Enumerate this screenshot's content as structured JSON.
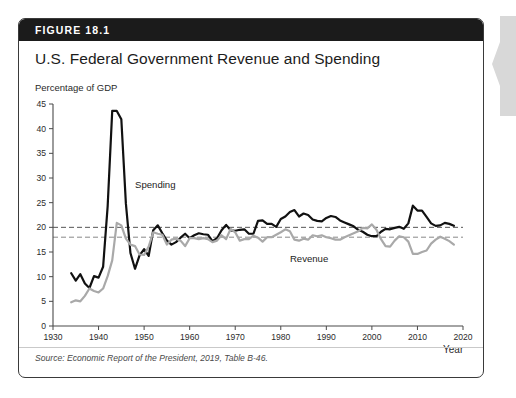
{
  "figure": {
    "number": "FIGURE 18.1",
    "title": "U.S. Federal Government Revenue and Spending",
    "source": "Source: Economic Report of the President, 2019, Table B-46.",
    "header_bg": "#1b1b1b",
    "card_border": "#3a3a3a"
  },
  "chart_data": {
    "type": "line",
    "title": "U.S. Federal Government Revenue and Spending",
    "ylabel": "Percentage of GDP",
    "xlabel": "Year",
    "xlim": [
      1930,
      2020
    ],
    "ylim": [
      0,
      45
    ],
    "xticks": [
      1930,
      1940,
      1950,
      1960,
      1970,
      1980,
      1990,
      2000,
      2010,
      2020
    ],
    "yticks": [
      0,
      5,
      10,
      15,
      20,
      25,
      30,
      35,
      40,
      45
    ],
    "grid": false,
    "legend": "inline-annotations",
    "annotations": [
      {
        "text": "Spending",
        "x": 1948,
        "y": 28.0,
        "color": "#1c1c1c"
      },
      {
        "text": "Revenue",
        "x": 1982,
        "y": 13.0,
        "color": "#1c1c1c"
      }
    ],
    "reference_lines": [
      {
        "label": "Average spending",
        "value": 20.0,
        "style": "dashed",
        "color": "#555555"
      },
      {
        "label": "Average revenue",
        "value": 18.0,
        "style": "dashed",
        "color": "#888888"
      }
    ],
    "series": [
      {
        "name": "Spending",
        "color": "#111111",
        "width": 2.2,
        "x": [
          1934,
          1935,
          1936,
          1937,
          1938,
          1939,
          1940,
          1941,
          1942,
          1943,
          1944,
          1945,
          1946,
          1947,
          1948,
          1949,
          1950,
          1951,
          1952,
          1953,
          1954,
          1955,
          1956,
          1957,
          1958,
          1959,
          1960,
          1961,
          1962,
          1963,
          1964,
          1965,
          1966,
          1967,
          1968,
          1969,
          1970,
          1971,
          1972,
          1973,
          1974,
          1975,
          1976,
          1977,
          1978,
          1979,
          1980,
          1981,
          1982,
          1983,
          1984,
          1985,
          1986,
          1987,
          1988,
          1989,
          1990,
          1991,
          1992,
          1993,
          1994,
          1995,
          1996,
          1997,
          1998,
          1999,
          2000,
          2001,
          2002,
          2003,
          2004,
          2005,
          2006,
          2007,
          2008,
          2009,
          2010,
          2011,
          2012,
          2013,
          2014,
          2015,
          2016,
          2017,
          2018
        ],
        "values": [
          10.7,
          9.2,
          10.5,
          8.6,
          7.7,
          10.1,
          9.8,
          12.0,
          24.3,
          43.6,
          43.6,
          41.9,
          24.8,
          14.8,
          11.6,
          14.3,
          15.6,
          14.2,
          19.4,
          20.4,
          18.8,
          17.3,
          16.5,
          17.0,
          17.9,
          18.7,
          17.8,
          18.4,
          18.8,
          18.6,
          18.5,
          17.2,
          17.8,
          19.4,
          20.5,
          19.4,
          19.3,
          19.5,
          19.6,
          18.7,
          18.7,
          21.3,
          21.4,
          20.7,
          20.7,
          20.1,
          21.7,
          22.2,
          23.1,
          23.5,
          22.2,
          22.8,
          22.5,
          21.6,
          21.3,
          21.2,
          21.9,
          22.3,
          22.1,
          21.4,
          21.0,
          20.6,
          20.2,
          19.5,
          19.1,
          18.5,
          18.2,
          18.2,
          19.1,
          19.7,
          19.6,
          19.9,
          20.1,
          19.7,
          20.8,
          24.4,
          23.4,
          23.4,
          22.1,
          20.8,
          20.3,
          20.4,
          20.9,
          20.7,
          20.3
        ]
      },
      {
        "name": "Revenue",
        "color": "#a9a9a9",
        "width": 2.2,
        "x": [
          1934,
          1935,
          1936,
          1937,
          1938,
          1939,
          1940,
          1941,
          1942,
          1943,
          1944,
          1945,
          1946,
          1947,
          1948,
          1949,
          1950,
          1951,
          1952,
          1953,
          1954,
          1955,
          1956,
          1957,
          1958,
          1959,
          1960,
          1961,
          1962,
          1963,
          1964,
          1965,
          1966,
          1967,
          1968,
          1969,
          1970,
          1971,
          1972,
          1973,
          1974,
          1975,
          1976,
          1977,
          1978,
          1979,
          1980,
          1981,
          1982,
          1983,
          1984,
          1985,
          1986,
          1987,
          1988,
          1989,
          1990,
          1991,
          1992,
          1993,
          1994,
          1995,
          1996,
          1997,
          1998,
          1999,
          2000,
          2001,
          2002,
          2003,
          2004,
          2005,
          2006,
          2007,
          2008,
          2009,
          2010,
          2011,
          2012,
          2013,
          2014,
          2015,
          2016,
          2017,
          2018
        ],
        "values": [
          4.8,
          5.2,
          5.0,
          6.1,
          7.6,
          7.1,
          6.8,
          7.6,
          10.1,
          13.3,
          20.9,
          20.4,
          17.7,
          16.5,
          16.2,
          14.5,
          14.4,
          16.1,
          19.0,
          18.7,
          18.5,
          16.5,
          17.5,
          17.7,
          17.3,
          16.2,
          17.8,
          17.8,
          17.6,
          17.8,
          17.6,
          17.0,
          17.3,
          18.4,
          17.6,
          19.7,
          19.0,
          17.3,
          17.6,
          17.6,
          18.3,
          17.9,
          17.1,
          18.0,
          18.0,
          18.5,
          19.0,
          19.6,
          19.2,
          17.5,
          17.3,
          17.7,
          17.5,
          18.4,
          18.2,
          18.4,
          18.0,
          17.8,
          17.5,
          17.5,
          18.0,
          18.4,
          18.8,
          19.2,
          19.9,
          19.8,
          20.6,
          19.5,
          17.6,
          16.2,
          16.1,
          17.3,
          18.2,
          18.0,
          17.1,
          14.6,
          14.6,
          15.0,
          15.3,
          16.7,
          17.5,
          18.1,
          17.7,
          17.2,
          16.5
        ]
      }
    ]
  }
}
